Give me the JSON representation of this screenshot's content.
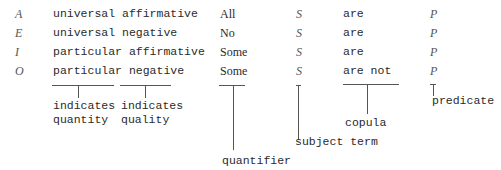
{
  "rows": [
    {
      "letter": "A",
      "type": "universal affirmative",
      "quantifier": "All",
      "subject": "S",
      "copula": "are",
      "predicate": "P"
    },
    {
      "letter": "E",
      "type": "universal negative",
      "quantifier": "No",
      "subject": "S",
      "copula": "are",
      "predicate": "P"
    },
    {
      "letter": "I",
      "type": "particular affirmative",
      "quantifier": "Some",
      "subject": "S",
      "copula": "are",
      "predicate": "P"
    },
    {
      "letter": "O",
      "type": "particular negative",
      "quantifier": "Some",
      "subject": "S",
      "copula": "are not",
      "predicate": "P"
    }
  ],
  "annotations": {
    "quantity": {
      "line1": "indicates",
      "line2": "quantity"
    },
    "quality": {
      "line1": "indicates",
      "line2": "quality"
    },
    "quantifier": "quantifier",
    "subject_term": "subject term",
    "copula": "copula",
    "predicate": "predicate"
  }
}
